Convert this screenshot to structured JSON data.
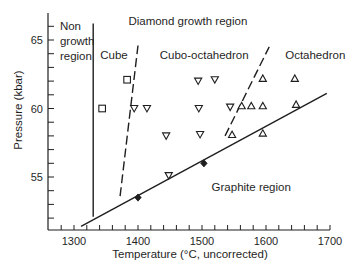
{
  "chart_data": {
    "type": "scatter",
    "title": "",
    "xlabel": "Temperature (°C, uncorrected)",
    "ylabel": "Pressure (kbar)",
    "xlim": [
      1260,
      1700
    ],
    "ylim": [
      51,
      67
    ],
    "x_ticks": [
      1300,
      1400,
      1500,
      1600,
      1700
    ],
    "x_tick_labels": [
      "1300",
      "1400",
      "1500",
      "1600",
      "1700"
    ],
    "x_minor_step": 20,
    "y_ticks": [
      55,
      60,
      65
    ],
    "y_tick_labels": [
      "55",
      "60",
      "65"
    ],
    "y_minor_step": 1,
    "grid": false,
    "region_labels": [
      {
        "text": "Non",
        "x": 1278,
        "y": 66.0
      },
      {
        "text": "growth",
        "x": 1278,
        "y": 64.9
      },
      {
        "text": "region",
        "x": 1278,
        "y": 63.8
      },
      {
        "text": "Diamond growth region",
        "x": 1385,
        "y": 66.4
      },
      {
        "text": "Cube",
        "x": 1341,
        "y": 63.9
      },
      {
        "text": "Cubo-octahedron",
        "x": 1434,
        "y": 63.9
      },
      {
        "text": "Octahedron",
        "x": 1630,
        "y": 63.9
      },
      {
        "text": "Graphite region",
        "x": 1515,
        "y": 54.3
      }
    ],
    "lines": [
      {
        "name": "graphite-diamond boundary",
        "style": "solid",
        "points": [
          [
            1311,
            51.4
          ],
          [
            1695,
            61.1
          ]
        ]
      },
      {
        "name": "non-growth boundary",
        "style": "solid",
        "points": [
          [
            1330,
            52.1
          ],
          [
            1330,
            66.2
          ]
        ]
      },
      {
        "name": "cube / cubo-octahedron boundary",
        "style": "dashed",
        "points": [
          [
            1372,
            53.6
          ],
          [
            1400,
            64.6
          ]
        ]
      },
      {
        "name": "cubo-octahedron / octahedron boundary",
        "style": "dashed",
        "points": [
          [
            1536,
            58.0
          ],
          [
            1605,
            64.5
          ]
        ]
      }
    ],
    "series": [
      {
        "name": "Cube",
        "marker": "square-open",
        "points": [
          [
            1344,
            60.0
          ],
          [
            1383,
            62.1
          ]
        ]
      },
      {
        "name": "Cubo-octahedron",
        "marker": "triangle-down-open",
        "points": [
          [
            1394,
            60.0
          ],
          [
            1414,
            60.0
          ],
          [
            1494,
            62.0
          ],
          [
            1520,
            62.1
          ],
          [
            1495,
            60.0
          ],
          [
            1544,
            60.1
          ],
          [
            1444,
            58.0
          ],
          [
            1497,
            58.1
          ],
          [
            1448,
            55.1
          ]
        ]
      },
      {
        "name": "Octahedron",
        "marker": "triangle-up-open",
        "points": [
          [
            1595,
            62.2
          ],
          [
            1645,
            62.2
          ],
          [
            1562,
            60.2
          ],
          [
            1577,
            60.2
          ],
          [
            1595,
            60.2
          ],
          [
            1647,
            60.3
          ],
          [
            1547,
            58.1
          ],
          [
            1595,
            58.2
          ]
        ]
      },
      {
        "name": "Graphite boundary points",
        "marker": "diamond-filled",
        "points": [
          [
            1400,
            53.5
          ],
          [
            1503,
            56.0
          ]
        ]
      }
    ]
  },
  "labels": {
    "xlabel": "Temperature (°C, uncorrected)",
    "ylabel": "Pressure (kbar)"
  }
}
